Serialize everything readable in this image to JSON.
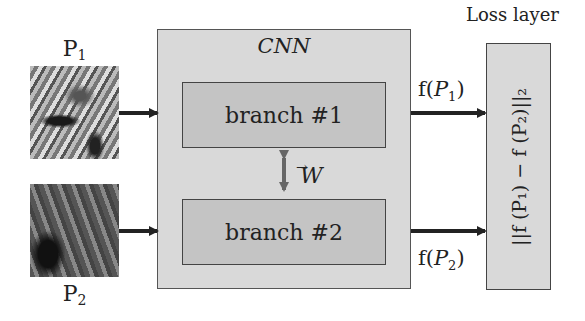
{
  "diagram": {
    "inputs": [
      {
        "label": "P",
        "subscript": "1"
      },
      {
        "label": "P",
        "subscript": "2"
      }
    ],
    "cnn": {
      "title": "CNN",
      "branches": [
        "branch #1",
        "branch #2"
      ],
      "shared_weights_label": "W",
      "shared_weights_arrow": "→"
    },
    "outputs": [
      {
        "prefix": "f(",
        "var": "P",
        "subscript": "1",
        "suffix": ")"
      },
      {
        "prefix": "f(",
        "var": "P",
        "subscript": "2",
        "suffix": ")"
      }
    ],
    "loss": {
      "title": "Loss layer",
      "formula": "||f (P₁) − f (P₂)||₂"
    },
    "colors": {
      "cnn_fill": "#d9d9d9",
      "branch_fill": "#c4c4c4",
      "loss_fill": "#d9d9d9",
      "arrow": "#222222",
      "shared_arrow": "#666666"
    }
  }
}
